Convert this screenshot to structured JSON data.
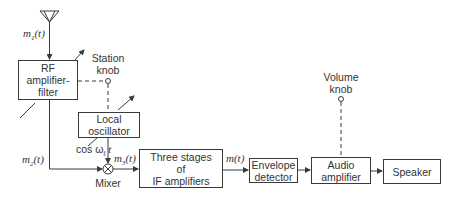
{
  "diagram": {
    "blocks": {
      "rf": {
        "lines": [
          "RF",
          "amplifier-",
          "filter"
        ]
      },
      "local_osc": {
        "lines": [
          "Local",
          "oscillator"
        ]
      },
      "if_amp": {
        "lines": [
          "Three stages",
          "of",
          "IF amplifiers"
        ]
      },
      "envelope": {
        "lines": [
          "Envelope",
          "detector"
        ]
      },
      "audio": {
        "lines": [
          "Audio",
          "amplifier"
        ]
      },
      "speaker": {
        "lines": [
          "Speaker"
        ]
      }
    },
    "knobs": {
      "station": {
        "lines": [
          "Station",
          "knob"
        ]
      },
      "volume": {
        "lines": [
          "Volume",
          "knob"
        ]
      }
    },
    "mixer": {
      "label": "Mixer",
      "symbol": "×"
    },
    "signals": {
      "m1": {
        "base": "m",
        "sub": "1",
        "arg": "(t)"
      },
      "m2": {
        "base": "m",
        "sub": "2",
        "arg": "(t)"
      },
      "m3": {
        "base": "m",
        "sub": "3",
        "arg": "(t)"
      },
      "m": {
        "base": "m",
        "arg": "(t)"
      },
      "lo": {
        "prefix": "cos ω",
        "sub": "ℓ",
        "suffix": " t"
      }
    },
    "colors": {
      "line": "#3a3a3a",
      "text": "#333333",
      "background": "#ffffff"
    }
  }
}
